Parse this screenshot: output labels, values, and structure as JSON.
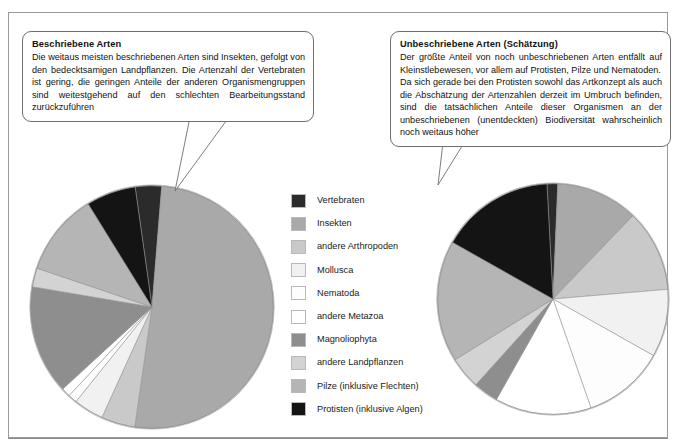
{
  "figure": {
    "frame_color": "#9a9a9a",
    "background": "#ffffff"
  },
  "callouts": {
    "left": {
      "title": "Beschriebene Arten",
      "body": "Die weitaus meisten beschriebenen Arten sind Insekten, gefolgt von den bedecktsamigen Landpflanzen. Die Artenzahl der Vertebraten ist gering, die geringen Anteile der anderen Organismengruppen sind weitestgehend auf den schlechten Bearbeitungsstand zurückzuführen"
    },
    "right": {
      "title": "Unbeschriebene Arten (Schätzung)",
      "body_1": "Der größte Anteil von noch unbeschriebenen Arten entfällt auf Kleinstlebewesen, vor allem auf Protisten, Pilze und Nematoden.",
      "body_2": "Da sich gerade bei den Protisten sowohl das Artkonzept als auch die Abschätzung der Artenzahlen derzeit im Umbruch befinden, sind die tatsächlichen Anteile dieser Organismen an der unbeschriebenen (unentdeckten) Biodiversität wahrscheinlich noch weitaus höher"
    }
  },
  "legend": {
    "position": "center",
    "items": [
      {
        "label": "Vertebraten",
        "color": "#2b2b2b"
      },
      {
        "label": "Insekten",
        "color": "#a9a9a9"
      },
      {
        "label": "andere Arthropoden",
        "color": "#c9c9c9"
      },
      {
        "label": "Mollusca",
        "color": "#f1f1f1"
      },
      {
        "label": "Nematoda",
        "color": "#fdfdfd"
      },
      {
        "label": "andere Metazoa",
        "color": "#ffffff"
      },
      {
        "label": "Magnoliophyta",
        "color": "#8e8e8e"
      },
      {
        "label": "andere Landpflanzen",
        "color": "#d3d3d3"
      },
      {
        "label": "Pilze (inklusive Flechten)",
        "color": "#b5b5b5"
      },
      {
        "label": "Protisten (inklusive Algen)",
        "color": "#141414"
      }
    ]
  },
  "chart_data": [
    {
      "type": "pie",
      "title": "Beschriebene Arten",
      "id": "pie-left",
      "start_angle_deg": -8,
      "direction": "clockwise",
      "categories": [
        "Vertebraten",
        "Insekten",
        "andere Arthropoden",
        "Mollusca",
        "Nematoda",
        "andere Metazoa",
        "Magnoliophyta",
        "andere Landpflanzen",
        "Pilze (inklusive Flechten)",
        "Protisten (inklusive Algen)"
      ],
      "values": [
        3.5,
        51.0,
        4.5,
        4.0,
        1.2,
        1.2,
        14.5,
        2.5,
        11.0,
        6.6
      ],
      "units": "percent",
      "colors": [
        "#2b2b2b",
        "#a9a9a9",
        "#c9c9c9",
        "#f1f1f1",
        "#fdfdfd",
        "#ffffff",
        "#8e8e8e",
        "#d3d3d3",
        "#b5b5b5",
        "#141414"
      ]
    },
    {
      "type": "pie",
      "title": "Unbeschriebene Arten (Schätzung)",
      "id": "pie-right",
      "start_angle_deg": -3,
      "direction": "clockwise",
      "categories": [
        "Vertebraten",
        "Insekten",
        "andere Arthropoden",
        "Mollusca",
        "Nematoda",
        "andere Metazoa",
        "Magnoliophyta",
        "andere Landpflanzen",
        "Pilze (inklusive Flechten)",
        "Protisten (inklusive Algen)"
      ],
      "values": [
        1.5,
        11.5,
        11.5,
        9.5,
        11.5,
        13.5,
        3.5,
        4.5,
        17.0,
        16.0
      ],
      "units": "percent",
      "colors": [
        "#2b2b2b",
        "#a9a9a9",
        "#c9c9c9",
        "#f1f1f1",
        "#fdfdfd",
        "#ffffff",
        "#8e8e8e",
        "#d3d3d3",
        "#b5b5b5",
        "#141414"
      ]
    }
  ],
  "footer": {
    "caption_cut_off": ""
  }
}
